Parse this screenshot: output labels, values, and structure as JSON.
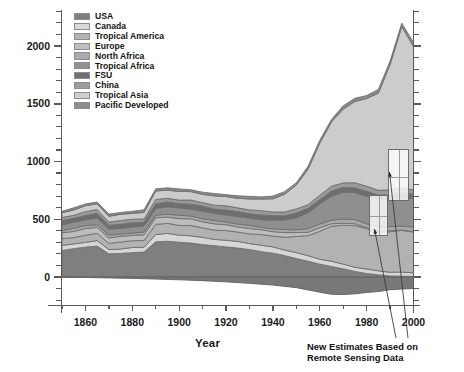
{
  "chart_data": {
    "type": "area",
    "title": "",
    "xlabel": "Year",
    "ylabel": "TgC/year",
    "xlim": [
      1850,
      2000
    ],
    "ylim": [
      -250,
      2350
    ],
    "grid": false,
    "stacked": true,
    "legend_position": "top-left",
    "x_ticks": [
      1860,
      1880,
      1900,
      1920,
      1940,
      1960,
      1980,
      2000
    ],
    "y_ticks": [
      0,
      500,
      1000,
      1500,
      2000
    ],
    "y_minor_step": 100,
    "x_minor_step": 10,
    "x": [
      1850,
      1855,
      1860,
      1865,
      1870,
      1875,
      1880,
      1885,
      1890,
      1895,
      1900,
      1905,
      1910,
      1915,
      1920,
      1925,
      1930,
      1935,
      1940,
      1945,
      1950,
      1955,
      1960,
      1965,
      1970,
      1975,
      1980,
      1985,
      1990,
      1995,
      2000
    ],
    "series": [
      {
        "name": "USA",
        "color": "#7f7f7f",
        "values": [
          230,
          245,
          260,
          268,
          200,
          205,
          210,
          215,
          305,
          308,
          300,
          295,
          280,
          272,
          262,
          250,
          238,
          220,
          205,
          185,
          160,
          135,
          112,
          92,
          70,
          50,
          30,
          18,
          10,
          6,
          4
        ]
      },
      {
        "name": "Canada",
        "color": "#d6d6d6",
        "values": [
          40,
          42,
          44,
          46,
          40,
          41,
          42,
          43,
          62,
          64,
          63,
          62,
          60,
          58,
          58,
          57,
          56,
          54,
          52,
          50,
          48,
          46,
          45,
          43,
          42,
          40,
          38,
          36,
          34,
          32,
          30
        ]
      },
      {
        "name": "Tropical America",
        "color": "#b2b2b2",
        "values": [
          55,
          57,
          60,
          62,
          58,
          59,
          60,
          61,
          85,
          86,
          85,
          84,
          83,
          82,
          82,
          84,
          86,
          90,
          96,
          110,
          135,
          175,
          240,
          300,
          340,
          360,
          350,
          340,
          350,
          360,
          355
        ]
      },
      {
        "name": "Europe",
        "color": "#bdbdbd",
        "values": [
          50,
          52,
          54,
          55,
          48,
          49,
          50,
          50,
          56,
          57,
          56,
          55,
          54,
          52,
          50,
          48,
          46,
          44,
          42,
          38,
          34,
          30,
          26,
          22,
          18,
          14,
          11,
          9,
          7,
          6,
          5
        ]
      },
      {
        "name": "North Africa",
        "color": "#a8a8a8",
        "values": [
          22,
          23,
          24,
          24,
          22,
          22,
          23,
          23,
          26,
          26,
          26,
          26,
          25,
          25,
          25,
          25,
          25,
          25,
          25,
          26,
          27,
          28,
          30,
          32,
          34,
          35,
          36,
          36,
          37,
          38,
          38
        ]
      },
      {
        "name": "Tropical Africa",
        "color": "#8f8f8f",
        "values": [
          48,
          50,
          52,
          54,
          50,
          51,
          52,
          53,
          62,
          63,
          63,
          62,
          62,
          61,
          61,
          62,
          64,
          68,
          74,
          86,
          106,
          136,
          176,
          208,
          228,
          236,
          236,
          236,
          240,
          246,
          248
        ]
      },
      {
        "name": "FSU",
        "color": "#6e6e6e",
        "values": [
          35,
          36,
          38,
          38,
          34,
          35,
          35,
          36,
          42,
          42,
          42,
          42,
          41,
          40,
          40,
          40,
          40,
          40,
          40,
          40,
          40,
          40,
          40,
          40,
          40,
          40,
          40,
          40,
          40,
          40,
          40
        ]
      },
      {
        "name": "China",
        "color": "#9a9a9a",
        "values": [
          28,
          29,
          30,
          31,
          28,
          29,
          29,
          30,
          34,
          34,
          34,
          34,
          33,
          33,
          33,
          33,
          33,
          33,
          33,
          34,
          35,
          36,
          38,
          40,
          42,
          42,
          42,
          42,
          42,
          42,
          42
        ]
      },
      {
        "name": "Tropical Asia",
        "color": "#cccccc",
        "values": [
          45,
          47,
          50,
          52,
          48,
          50,
          52,
          54,
          72,
          74,
          74,
          74,
          76,
          78,
          80,
          84,
          90,
          100,
          116,
          150,
          210,
          310,
          450,
          560,
          640,
          700,
          760,
          840,
          1080,
          1400,
          1240
        ]
      },
      {
        "name": "Pacific Developed",
        "color": "#8a8a8a",
        "values": [
          16,
          17,
          18,
          18,
          16,
          17,
          17,
          18,
          20,
          20,
          20,
          20,
          20,
          20,
          20,
          20,
          20,
          20,
          20,
          21,
          22,
          23,
          25,
          26,
          27,
          28,
          28,
          28,
          29,
          30,
          30
        ]
      }
    ],
    "negative_band": {
      "name": "net sink",
      "color": "#787878",
      "x": [
        1850,
        1860,
        1870,
        1880,
        1890,
        1900,
        1910,
        1920,
        1930,
        1940,
        1950,
        1955,
        1960,
        1965,
        1970,
        1975,
        1980,
        1985,
        1990,
        1995,
        2000
      ],
      "values": [
        0,
        -4,
        -8,
        -12,
        -18,
        -24,
        -32,
        -42,
        -55,
        -70,
        -92,
        -112,
        -132,
        -150,
        -152,
        -146,
        -134,
        -126,
        -110,
        -104,
        -100
      ]
    },
    "peak": {
      "year": 1996,
      "value": 2300
    },
    "annotation": {
      "lines": [
        "New Estimates Based on",
        "Remote Sensing Data"
      ],
      "highlight_boxes": [
        {
          "x_range": [
            1981,
            1989
          ],
          "y_range": [
            355,
            710
          ]
        },
        {
          "x_range": [
            1989,
            1998
          ],
          "y_range": [
            655,
            1105
          ]
        }
      ]
    }
  },
  "axis": {
    "y_title": "TgC/year",
    "x_title": "Year",
    "y_tick_labels": [
      "2000",
      "1500",
      "1000",
      "500",
      "0"
    ],
    "x_tick_labels": [
      "1860",
      "1880",
      "1900",
      "1920",
      "1940",
      "1960",
      "1980",
      "2000"
    ]
  },
  "legend": {
    "items": [
      {
        "label": "USA",
        "color": "#7f7f7f"
      },
      {
        "label": "Canada",
        "color": "#d9d9d9"
      },
      {
        "label": "Tropical America",
        "color": "#b4b4b4"
      },
      {
        "label": "Europe",
        "color": "#bfbfbf"
      },
      {
        "label": "North Africa",
        "color": "#ababab"
      },
      {
        "label": "Tropical Africa",
        "color": "#919191"
      },
      {
        "label": "FSU",
        "color": "#707070"
      },
      {
        "label": "China",
        "color": "#9c9c9c"
      },
      {
        "label": "Tropical Asia",
        "color": "#cfcfcf"
      },
      {
        "label": "Pacific Developed",
        "color": "#8c8c8c"
      }
    ]
  },
  "annotation": {
    "line1": "New Estimates Based on",
    "line2": "Remote Sensing Data"
  }
}
